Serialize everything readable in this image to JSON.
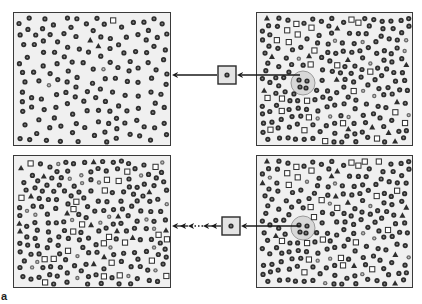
{
  "figure": {
    "label": "a",
    "colors": {
      "panel_fill": "#f0f0f0",
      "panel_border": "#3a3a3a",
      "particle": "#2e2e2e",
      "particle_core": "#8a8a8a",
      "highlight_circle_fill": "#d8d8d8",
      "highlight_circle_stroke": "#9a9a9a",
      "arrow": "#1a1a1a"
    }
  },
  "panels": [
    {
      "id": "top-left",
      "description": "Homogeneous field: mostly circle particles with few squares and triangles",
      "x": 13,
      "y": 12,
      "w": 158,
      "h": 134,
      "seed": 11,
      "count": 150,
      "mix": {
        "circle": 0.97,
        "light-circle": 0.01,
        "square": 0.01,
        "triangle": 0.01
      },
      "highlight": null
    },
    {
      "id": "top-right",
      "description": "Heterogeneous field: mixed circles, squares and triangles; circled sample region",
      "x": 256,
      "y": 12,
      "w": 157,
      "h": 134,
      "seed": 27,
      "count": 230,
      "mix": {
        "circle": 0.72,
        "light-circle": 0.1,
        "square": 0.1,
        "triangle": 0.08
      },
      "highlight": {
        "cx": 46,
        "cy": 70,
        "r": 12
      }
    },
    {
      "id": "bottom-left",
      "description": "Heterogeneous field after repeated sampling: mixed shapes",
      "x": 13,
      "y": 155,
      "w": 158,
      "h": 133,
      "seed": 53,
      "count": 230,
      "mix": {
        "circle": 0.72,
        "light-circle": 0.1,
        "square": 0.1,
        "triangle": 0.08
      },
      "highlight": null
    },
    {
      "id": "bottom-right",
      "description": "Heterogeneous field: mixed shapes; circled sample region",
      "x": 256,
      "y": 155,
      "w": 157,
      "h": 133,
      "seed": 27,
      "count": 230,
      "mix": {
        "circle": 0.72,
        "light-circle": 0.1,
        "square": 0.1,
        "triangle": 0.08
      },
      "highlight": {
        "cx": 46,
        "cy": 72,
        "r": 12
      }
    }
  ],
  "connectors": [
    {
      "id": "top-connector",
      "sample_box": {
        "x": 218,
        "y": 66,
        "w": 18,
        "h": 18
      },
      "arrow_in": {
        "x1": 300,
        "x2": 237,
        "y": 75
      },
      "arrow_out": {
        "x1": 217,
        "x2": 172,
        "y": 75,
        "style": "solid"
      }
    },
    {
      "id": "bottom-connector",
      "sample_box": {
        "x": 222,
        "y": 217,
        "w": 18,
        "h": 18
      },
      "arrow_in": {
        "x1": 300,
        "x2": 241,
        "y": 226
      },
      "arrow_out": {
        "x1": 221,
        "x2": 172,
        "y": 226,
        "style": "dotted-multi"
      }
    }
  ]
}
